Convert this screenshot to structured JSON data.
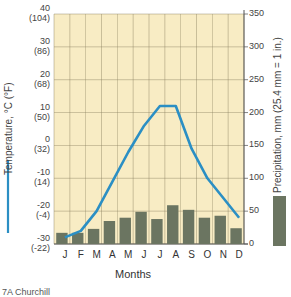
{
  "chart_data": {
    "type": "bar+line",
    "title": "",
    "categories": [
      "J",
      "F",
      "M",
      "A",
      "M",
      "J",
      "J",
      "A",
      "S",
      "O",
      "N",
      "D"
    ],
    "xlabel": "Months",
    "series": [
      {
        "name": "Temperature, °C (°F)",
        "type": "line",
        "axis": "left",
        "color": "#2b8fc4",
        "values": [
          -28,
          -26,
          -20,
          -11,
          -2,
          6,
          12,
          12,
          -1,
          -10,
          -16,
          -22
        ]
      },
      {
        "name": "Precipitation, mm (25.4 mm = 1 in.)",
        "type": "bar",
        "axis": "right",
        "color": "#6b7561",
        "values": [
          17,
          17,
          23,
          35,
          40,
          49,
          38,
          59,
          52,
          40,
          43,
          24
        ]
      }
    ],
    "y_left": {
      "label": "Temperature, °C (°F)",
      "range": [
        -30,
        40
      ],
      "ticks": [
        {
          "c": "40",
          "f": "(104)"
        },
        {
          "c": "30",
          "f": "(86)"
        },
        {
          "c": "20",
          "f": "(68)"
        },
        {
          "c": "10",
          "f": "(50)"
        },
        {
          "c": "0",
          "f": "(32)"
        },
        {
          "c": "-10",
          "f": "(14)"
        },
        {
          "c": "-20",
          "f": "(-4)"
        },
        {
          "c": "-30",
          "f": "(-22)"
        }
      ]
    },
    "y_right": {
      "label": "Precipitation, mm (25.4 mm = 1 in.)",
      "range": [
        0,
        350
      ],
      "ticks": [
        "350",
        "300",
        "250",
        "200",
        "150",
        "100",
        "50",
        "0"
      ]
    },
    "grid": true,
    "background": "#f8ecc4",
    "grid_color": "#8a8060",
    "legend_position": "outer-left and outer-right (vertical labels with swatches)"
  },
  "caption_partial": "7A  Churchill"
}
